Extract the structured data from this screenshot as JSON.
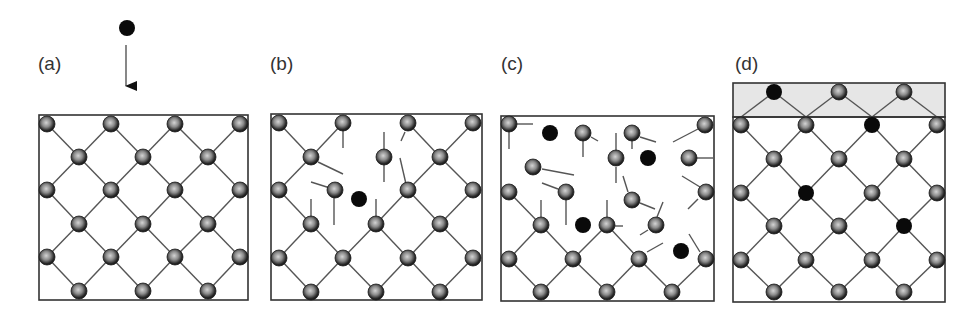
{
  "figure": {
    "colors": {
      "bond": "#555555",
      "frame": "#333333",
      "host_atom_center": "#c8c8c8",
      "host_atom_rim": "#1a1a1a",
      "impurity_atom": "#0a0a0a",
      "surface_layer_fill": "#e6e6e6"
    },
    "atom_radius": 8,
    "panels": [
      {
        "id": "a",
        "label": "(a)",
        "label_pos": [
          38,
          54
        ],
        "frame": [
          39,
          115,
          209,
          185
        ],
        "incoming": {
          "x": 127,
          "y": 28,
          "arrow_from": 45,
          "arrow_to": 98
        },
        "lattice": true,
        "atoms": [],
        "black": [],
        "lines": []
      },
      {
        "id": "b",
        "label": "(b)",
        "label_pos": [
          270,
          54
        ],
        "frame": [
          271,
          114,
          211,
          186
        ],
        "atoms": [
          [
            279,
            123
          ],
          [
            343,
            123
          ],
          [
            408,
            123
          ],
          [
            473,
            123
          ],
          [
            311,
            157
          ],
          [
            384,
            157
          ],
          [
            440,
            157
          ],
          [
            279,
            190
          ],
          [
            335,
            190
          ],
          [
            408,
            190
          ],
          [
            473,
            190
          ],
          [
            311,
            224
          ],
          [
            376,
            224
          ],
          [
            440,
            224
          ],
          [
            279,
            258
          ],
          [
            343,
            258
          ],
          [
            408,
            258
          ],
          [
            473,
            258
          ],
          [
            311,
            292
          ],
          [
            376,
            292
          ],
          [
            440,
            292
          ]
        ],
        "black": [
          [
            359,
            199
          ]
        ],
        "lines": [
          [
            279,
            123,
            311,
            157
          ],
          [
            343,
            123,
            311,
            157
          ],
          [
            408,
            123,
            440,
            157
          ],
          [
            473,
            123,
            440,
            157
          ],
          [
            343,
            130,
            343,
            148
          ],
          [
            318,
            162,
            343,
            174
          ],
          [
            384,
            132,
            384,
            150
          ],
          [
            384,
            165,
            384,
            182
          ],
          [
            405,
            132,
            401,
            141
          ],
          [
            400,
            158,
            406,
            184
          ],
          [
            279,
            190,
            311,
            157
          ],
          [
            408,
            190,
            440,
            157
          ],
          [
            473,
            190,
            440,
            157
          ],
          [
            311,
            182,
            330,
            188
          ],
          [
            334,
            197,
            334,
            225
          ],
          [
            311,
            199,
            311,
            218
          ],
          [
            376,
            199,
            376,
            218
          ],
          [
            279,
            190,
            311,
            224
          ],
          [
            408,
            190,
            376,
            224
          ],
          [
            408,
            190,
            440,
            224
          ],
          [
            473,
            190,
            440,
            224
          ],
          [
            311,
            224,
            279,
            258
          ],
          [
            311,
            224,
            343,
            258
          ],
          [
            376,
            224,
            343,
            258
          ],
          [
            376,
            224,
            408,
            258
          ],
          [
            440,
            224,
            408,
            258
          ],
          [
            440,
            224,
            473,
            258
          ],
          [
            279,
            258,
            311,
            292
          ],
          [
            343,
            258,
            311,
            292
          ],
          [
            343,
            258,
            376,
            292
          ],
          [
            408,
            258,
            376,
            292
          ],
          [
            408,
            258,
            440,
            292
          ],
          [
            473,
            258,
            440,
            292
          ]
        ]
      },
      {
        "id": "c",
        "label": "(c)",
        "label_pos": [
          501,
          54
        ],
        "frame": [
          501,
          116,
          213,
          185
        ],
        "atoms": [
          [
            509,
            124
          ],
          [
            583,
            133
          ],
          [
            632,
            133
          ],
          [
            705,
            125
          ],
          [
            616,
            158
          ],
          [
            689,
            158
          ],
          [
            533,
            167
          ],
          [
            509,
            192
          ],
          [
            566,
            192
          ],
          [
            632,
            200
          ],
          [
            706,
            192
          ],
          [
            541,
            225
          ],
          [
            607,
            225
          ],
          [
            656,
            225
          ],
          [
            509,
            259
          ],
          [
            573,
            259
          ],
          [
            639,
            259
          ],
          [
            706,
            259
          ],
          [
            541,
            292
          ],
          [
            607,
            292
          ],
          [
            672,
            292
          ]
        ],
        "black": [
          [
            550,
            133
          ],
          [
            648,
            158
          ],
          [
            583,
            225
          ],
          [
            681,
            251
          ]
        ],
        "lines": [
          [
            517,
            124,
            533,
            124
          ],
          [
            509,
            132,
            509,
            149
          ],
          [
            598,
            141,
            591,
            137
          ],
          [
            583,
            141,
            583,
            157
          ],
          [
            640,
            137,
            656,
            142
          ],
          [
            632,
            141,
            632,
            149
          ],
          [
            673,
            142,
            698,
            129
          ],
          [
            616,
            133,
            616,
            151
          ],
          [
            616,
            167,
            616,
            183
          ],
          [
            697,
            158,
            713,
            158
          ],
          [
            542,
            169,
            574,
            175
          ],
          [
            542,
            183,
            558,
            189
          ],
          [
            566,
            200,
            566,
            225
          ],
          [
            623,
            176,
            628,
            192
          ],
          [
            640,
            203,
            655,
            209
          ],
          [
            682,
            176,
            700,
            187
          ],
          [
            698,
            199,
            688,
            209
          ],
          [
            509,
            192,
            541,
            225
          ],
          [
            541,
            200,
            541,
            217
          ],
          [
            607,
            200,
            607,
            217
          ],
          [
            615,
            226,
            623,
            226
          ],
          [
            657,
            217,
            663,
            202
          ],
          [
            648,
            230,
            640,
            235
          ],
          [
            647,
            252,
            663,
            243
          ],
          [
            689,
            234,
            700,
            252
          ],
          [
            541,
            225,
            509,
            259
          ],
          [
            541,
            225,
            573,
            259
          ],
          [
            607,
            225,
            573,
            259
          ],
          [
            607,
            225,
            639,
            259
          ],
          [
            509,
            259,
            541,
            292
          ],
          [
            573,
            259,
            541,
            292
          ],
          [
            573,
            259,
            607,
            292
          ],
          [
            639,
            259,
            607,
            292
          ],
          [
            639,
            259,
            672,
            292
          ],
          [
            706,
            259,
            672,
            292
          ]
        ]
      },
      {
        "id": "d",
        "label": "(d)",
        "label_pos": [
          735,
          54
        ],
        "frame": [
          733,
          117,
          212,
          185
        ],
        "surface_layer": [
          733,
          83,
          212,
          34
        ],
        "atoms": [
          [
            839,
            92
          ],
          [
            904,
            92
          ],
          [
            741,
            125
          ],
          [
            806,
            125
          ],
          [
            937,
            125
          ],
          [
            774,
            159
          ],
          [
            839,
            159
          ],
          [
            904,
            159
          ],
          [
            741,
            193
          ],
          [
            872,
            193
          ],
          [
            937,
            193
          ],
          [
            774,
            226
          ],
          [
            839,
            226
          ],
          [
            741,
            260
          ],
          [
            806,
            260
          ],
          [
            872,
            260
          ],
          [
            937,
            260
          ],
          [
            774,
            292
          ],
          [
            839,
            292
          ],
          [
            904,
            292
          ]
        ],
        "black": [
          [
            774,
            92
          ],
          [
            872,
            125
          ],
          [
            806,
            193
          ],
          [
            904,
            226
          ]
        ],
        "lines": [
          [
            741,
            117,
            774,
            92
          ],
          [
            774,
            92,
            806,
            117
          ],
          [
            806,
            117,
            839,
            92
          ],
          [
            839,
            92,
            872,
            117
          ],
          [
            872,
            117,
            904,
            92
          ],
          [
            904,
            92,
            937,
            117
          ],
          [
            741,
            125,
            774,
            159
          ],
          [
            806,
            125,
            774,
            159
          ],
          [
            806,
            125,
            839,
            159
          ],
          [
            872,
            125,
            839,
            159
          ],
          [
            872,
            125,
            904,
            159
          ],
          [
            937,
            125,
            904,
            159
          ],
          [
            774,
            159,
            741,
            193
          ],
          [
            774,
            159,
            806,
            193
          ],
          [
            839,
            159,
            806,
            193
          ],
          [
            839,
            159,
            872,
            193
          ],
          [
            904,
            159,
            872,
            193
          ],
          [
            904,
            159,
            937,
            193
          ],
          [
            741,
            193,
            774,
            226
          ],
          [
            806,
            193,
            774,
            226
          ],
          [
            806,
            193,
            839,
            226
          ],
          [
            872,
            193,
            839,
            226
          ],
          [
            872,
            193,
            904,
            226
          ],
          [
            937,
            193,
            904,
            226
          ],
          [
            774,
            226,
            741,
            260
          ],
          [
            774,
            226,
            806,
            260
          ],
          [
            839,
            226,
            806,
            260
          ],
          [
            839,
            226,
            872,
            260
          ],
          [
            904,
            226,
            872,
            260
          ],
          [
            904,
            226,
            937,
            260
          ],
          [
            741,
            260,
            774,
            292
          ],
          [
            806,
            260,
            774,
            292
          ],
          [
            806,
            260,
            839,
            292
          ],
          [
            872,
            260,
            839,
            292
          ],
          [
            872,
            260,
            904,
            292
          ],
          [
            937,
            260,
            904,
            292
          ]
        ]
      }
    ],
    "lattice_a": {
      "even_rows_y": [
        124,
        190,
        257
      ],
      "odd_rows_y": [
        157,
        224,
        291
      ],
      "even_cols_x": [
        47,
        111,
        175,
        240
      ],
      "odd_cols_x": [
        79,
        143,
        208
      ]
    }
  }
}
